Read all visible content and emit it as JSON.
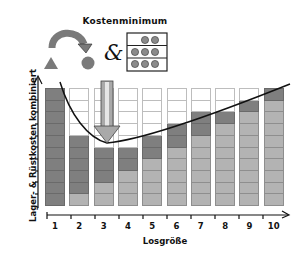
{
  "header": {
    "title": "Kostenminimum",
    "combine_symbol": "&"
  },
  "axes": {
    "ylabel": "Lager- & Rüstkosten kombiniert",
    "xlabel": "Losgröße"
  },
  "colors": {
    "setup_cost": "#7f7f7f",
    "storage_cost": "#b3b3b3",
    "empty": "#ffffff",
    "curve": "#111111"
  },
  "chart_data": {
    "type": "bar",
    "title": "Kostenminimum",
    "xlabel": "Losgröße",
    "ylabel": "Lager- & Rüstkosten kombiniert",
    "categories": [
      "1",
      "2",
      "3",
      "4",
      "5",
      "6",
      "7",
      "8",
      "9",
      "10"
    ],
    "series": [
      {
        "name": "Rüstkosten",
        "color": "#7f7f7f",
        "values": [
          10,
          5,
          3,
          2,
          2,
          2,
          2,
          1,
          1,
          1
        ]
      },
      {
        "name": "Lagerkosten",
        "color": "#b3b3b3",
        "values": [
          0,
          1,
          2,
          3,
          4,
          5,
          6,
          7,
          8,
          9
        ]
      }
    ],
    "totals": [
      10,
      6,
      5,
      5,
      6,
      7,
      8,
      8,
      9,
      10
    ],
    "stacked": true,
    "ylim": [
      0,
      10
    ],
    "minimum_at": "3",
    "annotations": [
      "Arrow pointing to minimum at Losgröße 3",
      "Curve of combined costs"
    ]
  }
}
